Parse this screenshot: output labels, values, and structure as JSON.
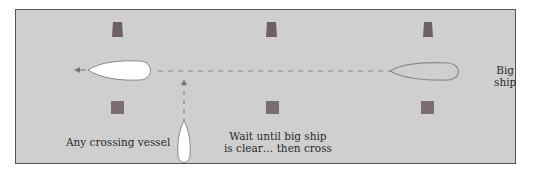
{
  "diagram": {
    "type": "channel-crossing-rule",
    "background_color": "#cfcfcf",
    "marker_color": "#7a6a6a",
    "labels": {
      "big_ship_line1": "Big",
      "big_ship_line2": "ship",
      "crossing_vessel": "Any crossing vessel",
      "wait_line1": "Wait until big ship",
      "wait_line2": "is clear… then cross"
    },
    "markers": {
      "top_row": [
        "port-marker-1",
        "port-marker-2",
        "port-marker-3"
      ],
      "bottom_row": [
        "starboard-marker-1",
        "starboard-marker-2",
        "starboard-marker-3"
      ]
    },
    "vessels": [
      {
        "name": "small-vessel-in-channel",
        "color": "#ffffff",
        "direction": "west"
      },
      {
        "name": "big-ship",
        "color": "#cfcfcf",
        "direction": "west"
      },
      {
        "name": "crossing-vessel",
        "color": "#ffffff",
        "direction": "north"
      }
    ]
  }
}
